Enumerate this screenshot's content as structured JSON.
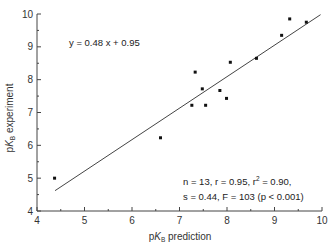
{
  "chart_data": {
    "type": "scatter",
    "title": "",
    "xlabel": {
      "prefix": "p",
      "italic": "K",
      "sub": "B",
      "suffix": " prediction"
    },
    "ylabel": {
      "prefix": "p",
      "italic": "K",
      "sub": "B",
      "suffix": " experiment"
    },
    "xlim": [
      4,
      10
    ],
    "ylim": [
      4,
      10
    ],
    "xticks": [
      4,
      5,
      6,
      7,
      8,
      9,
      10
    ],
    "yticks": [
      4,
      5,
      6,
      7,
      8,
      9,
      10
    ],
    "xminor": [
      4.5,
      5.5,
      6.5,
      7.5,
      8.5,
      9.5
    ],
    "yminor": [
      4.5,
      5.5,
      6.5,
      7.5,
      8.5,
      9.5
    ],
    "grid": false,
    "points": [
      {
        "x": 4.37,
        "y": 5.0
      },
      {
        "x": 6.6,
        "y": 6.23
      },
      {
        "x": 7.26,
        "y": 7.22
      },
      {
        "x": 7.33,
        "y": 8.23
      },
      {
        "x": 7.48,
        "y": 7.72
      },
      {
        "x": 7.55,
        "y": 7.22
      },
      {
        "x": 7.85,
        "y": 7.67
      },
      {
        "x": 7.99,
        "y": 7.43
      },
      {
        "x": 8.07,
        "y": 8.53
      },
      {
        "x": 8.62,
        "y": 8.65
      },
      {
        "x": 9.15,
        "y": 9.35
      },
      {
        "x": 9.32,
        "y": 9.85
      },
      {
        "x": 9.67,
        "y": 9.75
      }
    ],
    "fit_line": {
      "x_start": 4.38,
      "y_start": 4.62,
      "x_end": 9.97,
      "y_end": 9.98
    },
    "annotations": {
      "equation": "y = 0.48 x + 0.95",
      "stats_line1_a": "n = 13, r = 0.95, r",
      "stats_line1_sup": "2",
      "stats_line1_b": " = 0.90,",
      "stats_line2": "s = 0.44, F = 103 (p < 0.001)"
    }
  }
}
